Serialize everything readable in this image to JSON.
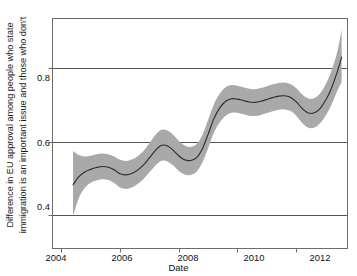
{
  "figure": {
    "title_partial": "Model estimates",
    "title_note": "title cropped at top edge of screenshot"
  },
  "axes": {
    "xlabel": "Date",
    "ylabel_line1": "Difference in EU approval among people who state",
    "ylabel_line2": "immigration is an important issue and those who don't",
    "xticks": [
      "2004",
      "2006",
      "2008",
      "2010",
      "2012"
    ],
    "yticks": [
      "0.4",
      "0.6",
      "0.8"
    ]
  },
  "colors": {
    "band": "#a9a9a9",
    "line": "#2b2b2b",
    "grid": "#555555",
    "frame": "#6b6b6b",
    "text": "#111111",
    "background": "#ffffff"
  },
  "chart_data": {
    "type": "line",
    "title": "Model estimates",
    "xlabel": "Date",
    "ylabel": "Difference in EU approval among people who state immigration is an important issue and those who don't",
    "xlim": [
      2003.7,
      2013.75
    ],
    "ylim": [
      0.31,
      0.935
    ],
    "xticks": [
      2004,
      2006,
      2008,
      2010,
      2012
    ],
    "yticks": [
      0.4,
      0.6,
      0.8
    ],
    "grid": "horizontal gridlines at y ticks",
    "legend": "none",
    "series": [
      {
        "name": "Estimated difference (posterior mean)",
        "style": "solid dark line",
        "x": [
          2004.4,
          2004.6,
          2004.8,
          2005.0,
          2005.2,
          2005.4,
          2005.6,
          2005.8,
          2006.0,
          2006.2,
          2006.4,
          2006.6,
          2006.8,
          2007.0,
          2007.2,
          2007.4,
          2007.6,
          2007.8,
          2008.0,
          2008.2,
          2008.4,
          2008.6,
          2008.8,
          2009.0,
          2009.2,
          2009.4,
          2009.6,
          2009.8,
          2010.0,
          2010.2,
          2010.4,
          2010.6,
          2010.8,
          2011.0,
          2011.2,
          2011.4,
          2011.6,
          2011.8,
          2012.0,
          2012.2,
          2012.4,
          2012.6,
          2012.8,
          2013.0,
          2013.2,
          2013.4,
          2013.55
        ],
        "values": [
          0.483,
          0.505,
          0.518,
          0.525,
          0.53,
          0.533,
          0.531,
          0.524,
          0.513,
          0.51,
          0.514,
          0.523,
          0.537,
          0.556,
          0.576,
          0.59,
          0.589,
          0.578,
          0.562,
          0.551,
          0.549,
          0.556,
          0.58,
          0.62,
          0.663,
          0.692,
          0.71,
          0.717,
          0.716,
          0.712,
          0.708,
          0.707,
          0.71,
          0.715,
          0.72,
          0.724,
          0.725,
          0.721,
          0.709,
          0.691,
          0.679,
          0.678,
          0.689,
          0.712,
          0.745,
          0.79,
          0.83
        ]
      }
    ],
    "bands": [
      {
        "name": "Credible interval",
        "fill": "#a9a9a9",
        "x": [
          2004.4,
          2004.6,
          2004.8,
          2005.0,
          2005.2,
          2005.4,
          2005.6,
          2005.8,
          2006.0,
          2006.2,
          2006.4,
          2006.6,
          2006.8,
          2007.0,
          2007.2,
          2007.4,
          2007.6,
          2007.8,
          2008.0,
          2008.2,
          2008.4,
          2008.6,
          2008.8,
          2009.0,
          2009.2,
          2009.4,
          2009.6,
          2009.8,
          2010.0,
          2010.2,
          2010.4,
          2010.6,
          2010.8,
          2011.0,
          2011.2,
          2011.4,
          2011.6,
          2011.8,
          2012.0,
          2012.2,
          2012.4,
          2012.6,
          2012.8,
          2013.0,
          2013.2,
          2013.4,
          2013.55
        ],
        "upper": [
          0.575,
          0.564,
          0.56,
          0.562,
          0.566,
          0.568,
          0.566,
          0.56,
          0.551,
          0.548,
          0.552,
          0.561,
          0.575,
          0.596,
          0.618,
          0.632,
          0.631,
          0.62,
          0.603,
          0.59,
          0.586,
          0.593,
          0.617,
          0.659,
          0.702,
          0.731,
          0.748,
          0.754,
          0.752,
          0.748,
          0.744,
          0.743,
          0.746,
          0.751,
          0.756,
          0.76,
          0.761,
          0.757,
          0.746,
          0.729,
          0.718,
          0.718,
          0.73,
          0.755,
          0.792,
          0.844,
          0.905
        ],
        "lower": [
          0.398,
          0.448,
          0.475,
          0.489,
          0.495,
          0.498,
          0.496,
          0.488,
          0.476,
          0.472,
          0.476,
          0.485,
          0.499,
          0.517,
          0.535,
          0.548,
          0.547,
          0.536,
          0.521,
          0.511,
          0.51,
          0.518,
          0.543,
          0.582,
          0.625,
          0.653,
          0.671,
          0.679,
          0.679,
          0.675,
          0.671,
          0.67,
          0.673,
          0.678,
          0.683,
          0.687,
          0.688,
          0.684,
          0.671,
          0.652,
          0.639,
          0.638,
          0.649,
          0.67,
          0.7,
          0.738,
          0.762
        ]
      }
    ]
  }
}
